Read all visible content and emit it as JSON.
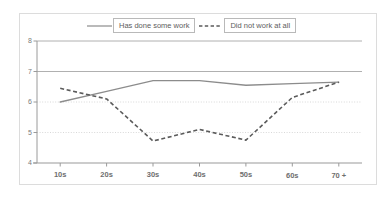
{
  "chart_data": {
    "type": "line",
    "title": "",
    "subtitle": "",
    "xlabel": "",
    "ylabel": "",
    "categories": [
      "10s",
      "20s",
      "30s",
      "40s",
      "50s",
      "60s",
      "70 +"
    ],
    "series": [
      {
        "name": "Has done some work",
        "style": "solid",
        "color": "#8c8c8c",
        "values": [
          6.0,
          6.35,
          6.7,
          6.7,
          6.55,
          6.6,
          6.65
        ]
      },
      {
        "name": "Did not work at all",
        "style": "dashed",
        "color": "#5b5b5b",
        "values": [
          6.45,
          6.1,
          4.72,
          5.1,
          4.75,
          6.15,
          6.65
        ]
      }
    ],
    "ylim": [
      4,
      8
    ],
    "yticks": [
      4,
      5,
      6,
      7,
      8
    ],
    "ytick_labels": [
      "4",
      "5",
      "6",
      "7",
      "8"
    ],
    "grid": true,
    "gridlines": [
      {
        "value": 8,
        "style": "solid"
      },
      {
        "value": 7,
        "style": "solid"
      },
      {
        "value": 6,
        "style": "dotted"
      },
      {
        "value": 5,
        "style": "dotted"
      },
      {
        "value": 4,
        "style": "solid"
      }
    ],
    "legend_position": "top-center",
    "legend": [
      "Has done some work",
      "Did not work at all"
    ]
  },
  "legend": {
    "entries": [
      {
        "label": "Has done some work"
      },
      {
        "label": "Did not work at all"
      }
    ]
  },
  "axes": {
    "y": {
      "labels": [
        "8",
        "7",
        "6",
        "5",
        "4"
      ]
    },
    "x": {
      "labels": [
        "10s",
        "20s",
        "30s",
        "40s",
        "50s",
        "60s",
        "70 +"
      ]
    }
  },
  "colors": {
    "series_solid": "#8c8c8c",
    "series_dashed": "#5b5b5b",
    "axis": "#9a9a9a",
    "gridline_solid": "#b0b0b0",
    "gridline_dotted": "#d8d8d8",
    "frame": "#dcdcdc",
    "tick_text": "#6e6e6e"
  }
}
